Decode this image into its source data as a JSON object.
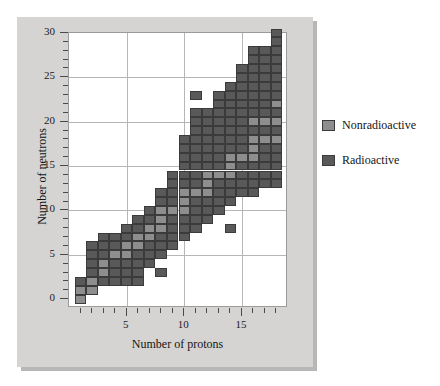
{
  "chart_data": {
    "type": "heatmap",
    "title": "",
    "xlabel": "Number of protons",
    "ylabel": "Number of neutrons",
    "xlim": [
      0,
      19
    ],
    "ylim": [
      -1,
      30
    ],
    "grid": true,
    "legend_position": "right",
    "x_major_ticks": [
      5,
      10,
      15
    ],
    "x_major_tick_labels": [
      "5",
      "10",
      "15"
    ],
    "x_minor_ticks": [
      1,
      2,
      3,
      4,
      6,
      7,
      8,
      9,
      11,
      12,
      13,
      14,
      16,
      17,
      18
    ],
    "y_major_ticks": [
      0,
      5,
      10,
      15,
      20,
      25,
      30
    ],
    "y_major_tick_labels": [
      "0",
      "5",
      "10",
      "15",
      "20",
      "25",
      "30"
    ],
    "y_minor_ticks": [
      1,
      2,
      3,
      4,
      6,
      7,
      8,
      9,
      11,
      12,
      13,
      14,
      16,
      17,
      18,
      19,
      21,
      22,
      23,
      24,
      26,
      27,
      28,
      29
    ],
    "categories_x": [
      1,
      2,
      3,
      4,
      5,
      6,
      7,
      8,
      9,
      10,
      11,
      12,
      13,
      14,
      15,
      16,
      17,
      18
    ],
    "legend": [
      {
        "label": "Nonradioactive",
        "color": "#8e8e8e"
      },
      {
        "label": "Radioactive",
        "color": "#595959"
      }
    ],
    "colors": {
      "nonradioactive": "#8e8e8e",
      "radioactive": "#595959",
      "cell_border": "#3b3b3b",
      "panel_background": "#d6d4d2",
      "plot_background": "#ffffff",
      "gridline": "#b6b6b6",
      "axis": "#9a9a9a",
      "text": "#141414"
    },
    "cells": [
      {
        "p": 1,
        "n": 0,
        "s": "nonradioactive"
      },
      {
        "p": 1,
        "n": 1,
        "s": "nonradioactive"
      },
      {
        "p": 1,
        "n": 2,
        "s": "radioactive"
      },
      {
        "p": 2,
        "n": 1,
        "s": "nonradioactive"
      },
      {
        "p": 2,
        "n": 2,
        "s": "nonradioactive"
      },
      {
        "p": 2,
        "n": 3,
        "s": "radioactive"
      },
      {
        "p": 2,
        "n": 4,
        "s": "radioactive"
      },
      {
        "p": 2,
        "n": 5,
        "s": "radioactive"
      },
      {
        "p": 2,
        "n": 6,
        "s": "radioactive"
      },
      {
        "p": 3,
        "n": 2,
        "s": "radioactive"
      },
      {
        "p": 3,
        "n": 3,
        "s": "nonradioactive"
      },
      {
        "p": 3,
        "n": 4,
        "s": "nonradioactive"
      },
      {
        "p": 3,
        "n": 5,
        "s": "radioactive"
      },
      {
        "p": 3,
        "n": 6,
        "s": "radioactive"
      },
      {
        "p": 3,
        "n": 7,
        "s": "radioactive"
      },
      {
        "p": 4,
        "n": 2,
        "s": "radioactive"
      },
      {
        "p": 4,
        "n": 3,
        "s": "radioactive"
      },
      {
        "p": 4,
        "n": 4,
        "s": "radioactive"
      },
      {
        "p": 4,
        "n": 5,
        "s": "nonradioactive"
      },
      {
        "p": 4,
        "n": 6,
        "s": "radioactive"
      },
      {
        "p": 4,
        "n": 7,
        "s": "radioactive"
      },
      {
        "p": 5,
        "n": 2,
        "s": "radioactive"
      },
      {
        "p": 5,
        "n": 3,
        "s": "radioactive"
      },
      {
        "p": 5,
        "n": 4,
        "s": "radioactive"
      },
      {
        "p": 5,
        "n": 5,
        "s": "nonradioactive"
      },
      {
        "p": 5,
        "n": 6,
        "s": "nonradioactive"
      },
      {
        "p": 5,
        "n": 7,
        "s": "radioactive"
      },
      {
        "p": 5,
        "n": 8,
        "s": "radioactive"
      },
      {
        "p": 6,
        "n": 2,
        "s": "radioactive"
      },
      {
        "p": 6,
        "n": 3,
        "s": "radioactive"
      },
      {
        "p": 6,
        "n": 4,
        "s": "radioactive"
      },
      {
        "p": 6,
        "n": 5,
        "s": "radioactive"
      },
      {
        "p": 6,
        "n": 6,
        "s": "nonradioactive"
      },
      {
        "p": 6,
        "n": 7,
        "s": "nonradioactive"
      },
      {
        "p": 6,
        "n": 8,
        "s": "radioactive"
      },
      {
        "p": 6,
        "n": 9,
        "s": "radioactive"
      },
      {
        "p": 7,
        "n": 4,
        "s": "radioactive"
      },
      {
        "p": 7,
        "n": 5,
        "s": "radioactive"
      },
      {
        "p": 7,
        "n": 6,
        "s": "radioactive"
      },
      {
        "p": 7,
        "n": 7,
        "s": "nonradioactive"
      },
      {
        "p": 7,
        "n": 8,
        "s": "nonradioactive"
      },
      {
        "p": 7,
        "n": 9,
        "s": "radioactive"
      },
      {
        "p": 7,
        "n": 10,
        "s": "radioactive"
      },
      {
        "p": 8,
        "n": 3,
        "s": "radioactive"
      },
      {
        "p": 8,
        "n": 5,
        "s": "radioactive"
      },
      {
        "p": 8,
        "n": 6,
        "s": "radioactive"
      },
      {
        "p": 8,
        "n": 7,
        "s": "radioactive"
      },
      {
        "p": 8,
        "n": 8,
        "s": "nonradioactive"
      },
      {
        "p": 8,
        "n": 9,
        "s": "nonradioactive"
      },
      {
        "p": 8,
        "n": 10,
        "s": "nonradioactive"
      },
      {
        "p": 8,
        "n": 11,
        "s": "radioactive"
      },
      {
        "p": 8,
        "n": 12,
        "s": "radioactive"
      },
      {
        "p": 9,
        "n": 6,
        "s": "radioactive"
      },
      {
        "p": 9,
        "n": 7,
        "s": "radioactive"
      },
      {
        "p": 9,
        "n": 8,
        "s": "radioactive"
      },
      {
        "p": 9,
        "n": 9,
        "s": "radioactive"
      },
      {
        "p": 9,
        "n": 10,
        "s": "nonradioactive"
      },
      {
        "p": 9,
        "n": 11,
        "s": "radioactive"
      },
      {
        "p": 9,
        "n": 12,
        "s": "radioactive"
      },
      {
        "p": 9,
        "n": 13,
        "s": "radioactive"
      },
      {
        "p": 9,
        "n": 14,
        "s": "radioactive"
      },
      {
        "p": 10,
        "n": 7,
        "s": "radioactive"
      },
      {
        "p": 10,
        "n": 8,
        "s": "radioactive"
      },
      {
        "p": 10,
        "n": 9,
        "s": "radioactive"
      },
      {
        "p": 10,
        "n": 10,
        "s": "nonradioactive"
      },
      {
        "p": 10,
        "n": 11,
        "s": "nonradioactive"
      },
      {
        "p": 10,
        "n": 12,
        "s": "nonradioactive"
      },
      {
        "p": 10,
        "n": 13,
        "s": "radioactive"
      },
      {
        "p": 10,
        "n": 14,
        "s": "radioactive"
      },
      {
        "p": 10,
        "n": 15,
        "s": "radioactive"
      },
      {
        "p": 10,
        "n": 16,
        "s": "radioactive"
      },
      {
        "p": 10,
        "n": 17,
        "s": "radioactive"
      },
      {
        "p": 10,
        "n": 18,
        "s": "radioactive"
      },
      {
        "p": 11,
        "n": 8,
        "s": "radioactive"
      },
      {
        "p": 11,
        "n": 9,
        "s": "radioactive"
      },
      {
        "p": 11,
        "n": 10,
        "s": "radioactive"
      },
      {
        "p": 11,
        "n": 11,
        "s": "radioactive"
      },
      {
        "p": 11,
        "n": 12,
        "s": "nonradioactive"
      },
      {
        "p": 11,
        "n": 13,
        "s": "radioactive"
      },
      {
        "p": 11,
        "n": 14,
        "s": "radioactive"
      },
      {
        "p": 11,
        "n": 15,
        "s": "radioactive"
      },
      {
        "p": 11,
        "n": 16,
        "s": "radioactive"
      },
      {
        "p": 11,
        "n": 17,
        "s": "radioactive"
      },
      {
        "p": 11,
        "n": 18,
        "s": "radioactive"
      },
      {
        "p": 11,
        "n": 19,
        "s": "radioactive"
      },
      {
        "p": 11,
        "n": 20,
        "s": "radioactive"
      },
      {
        "p": 11,
        "n": 21,
        "s": "radioactive"
      },
      {
        "p": 11,
        "n": 23,
        "s": "radioactive"
      },
      {
        "p": 12,
        "n": 9,
        "s": "radioactive"
      },
      {
        "p": 12,
        "n": 10,
        "s": "radioactive"
      },
      {
        "p": 12,
        "n": 11,
        "s": "radioactive"
      },
      {
        "p": 12,
        "n": 12,
        "s": "nonradioactive"
      },
      {
        "p": 12,
        "n": 13,
        "s": "nonradioactive"
      },
      {
        "p": 12,
        "n": 14,
        "s": "nonradioactive"
      },
      {
        "p": 12,
        "n": 15,
        "s": "radioactive"
      },
      {
        "p": 12,
        "n": 16,
        "s": "radioactive"
      },
      {
        "p": 12,
        "n": 17,
        "s": "radioactive"
      },
      {
        "p": 12,
        "n": 18,
        "s": "radioactive"
      },
      {
        "p": 12,
        "n": 19,
        "s": "radioactive"
      },
      {
        "p": 12,
        "n": 20,
        "s": "radioactive"
      },
      {
        "p": 12,
        "n": 21,
        "s": "radioactive"
      },
      {
        "p": 13,
        "n": 10,
        "s": "radioactive"
      },
      {
        "p": 13,
        "n": 11,
        "s": "radioactive"
      },
      {
        "p": 13,
        "n": 12,
        "s": "radioactive"
      },
      {
        "p": 13,
        "n": 13,
        "s": "radioactive"
      },
      {
        "p": 13,
        "n": 14,
        "s": "nonradioactive"
      },
      {
        "p": 13,
        "n": 15,
        "s": "radioactive"
      },
      {
        "p": 13,
        "n": 16,
        "s": "radioactive"
      },
      {
        "p": 13,
        "n": 17,
        "s": "radioactive"
      },
      {
        "p": 13,
        "n": 18,
        "s": "radioactive"
      },
      {
        "p": 13,
        "n": 19,
        "s": "radioactive"
      },
      {
        "p": 13,
        "n": 20,
        "s": "radioactive"
      },
      {
        "p": 13,
        "n": 21,
        "s": "radioactive"
      },
      {
        "p": 13,
        "n": 22,
        "s": "radioactive"
      },
      {
        "p": 13,
        "n": 23,
        "s": "radioactive"
      },
      {
        "p": 14,
        "n": 8,
        "s": "radioactive"
      },
      {
        "p": 14,
        "n": 11,
        "s": "radioactive"
      },
      {
        "p": 14,
        "n": 12,
        "s": "radioactive"
      },
      {
        "p": 14,
        "n": 13,
        "s": "radioactive"
      },
      {
        "p": 14,
        "n": 14,
        "s": "nonradioactive"
      },
      {
        "p": 14,
        "n": 15,
        "s": "nonradioactive"
      },
      {
        "p": 14,
        "n": 16,
        "s": "nonradioactive"
      },
      {
        "p": 14,
        "n": 17,
        "s": "radioactive"
      },
      {
        "p": 14,
        "n": 18,
        "s": "radioactive"
      },
      {
        "p": 14,
        "n": 19,
        "s": "radioactive"
      },
      {
        "p": 14,
        "n": 20,
        "s": "radioactive"
      },
      {
        "p": 14,
        "n": 21,
        "s": "radioactive"
      },
      {
        "p": 14,
        "n": 22,
        "s": "radioactive"
      },
      {
        "p": 14,
        "n": 23,
        "s": "radioactive"
      },
      {
        "p": 14,
        "n": 24,
        "s": "radioactive"
      },
      {
        "p": 15,
        "n": 12,
        "s": "radioactive"
      },
      {
        "p": 15,
        "n": 13,
        "s": "radioactive"
      },
      {
        "p": 15,
        "n": 14,
        "s": "radioactive"
      },
      {
        "p": 15,
        "n": 15,
        "s": "radioactive"
      },
      {
        "p": 15,
        "n": 16,
        "s": "nonradioactive"
      },
      {
        "p": 15,
        "n": 17,
        "s": "radioactive"
      },
      {
        "p": 15,
        "n": 18,
        "s": "radioactive"
      },
      {
        "p": 15,
        "n": 19,
        "s": "radioactive"
      },
      {
        "p": 15,
        "n": 20,
        "s": "radioactive"
      },
      {
        "p": 15,
        "n": 21,
        "s": "radioactive"
      },
      {
        "p": 15,
        "n": 22,
        "s": "radioactive"
      },
      {
        "p": 15,
        "n": 23,
        "s": "radioactive"
      },
      {
        "p": 15,
        "n": 24,
        "s": "radioactive"
      },
      {
        "p": 15,
        "n": 25,
        "s": "radioactive"
      },
      {
        "p": 15,
        "n": 26,
        "s": "radioactive"
      },
      {
        "p": 16,
        "n": 12,
        "s": "radioactive"
      },
      {
        "p": 16,
        "n": 13,
        "s": "radioactive"
      },
      {
        "p": 16,
        "n": 14,
        "s": "radioactive"
      },
      {
        "p": 16,
        "n": 15,
        "s": "radioactive"
      },
      {
        "p": 16,
        "n": 16,
        "s": "nonradioactive"
      },
      {
        "p": 16,
        "n": 17,
        "s": "nonradioactive"
      },
      {
        "p": 16,
        "n": 18,
        "s": "nonradioactive"
      },
      {
        "p": 16,
        "n": 19,
        "s": "radioactive"
      },
      {
        "p": 16,
        "n": 20,
        "s": "nonradioactive"
      },
      {
        "p": 16,
        "n": 21,
        "s": "radioactive"
      },
      {
        "p": 16,
        "n": 22,
        "s": "radioactive"
      },
      {
        "p": 16,
        "n": 23,
        "s": "radioactive"
      },
      {
        "p": 16,
        "n": 24,
        "s": "radioactive"
      },
      {
        "p": 16,
        "n": 25,
        "s": "radioactive"
      },
      {
        "p": 16,
        "n": 26,
        "s": "radioactive"
      },
      {
        "p": 16,
        "n": 27,
        "s": "radioactive"
      },
      {
        "p": 16,
        "n": 28,
        "s": "radioactive"
      },
      {
        "p": 17,
        "n": 13,
        "s": "radioactive"
      },
      {
        "p": 17,
        "n": 14,
        "s": "radioactive"
      },
      {
        "p": 17,
        "n": 15,
        "s": "radioactive"
      },
      {
        "p": 17,
        "n": 16,
        "s": "radioactive"
      },
      {
        "p": 17,
        "n": 17,
        "s": "radioactive"
      },
      {
        "p": 17,
        "n": 18,
        "s": "nonradioactive"
      },
      {
        "p": 17,
        "n": 19,
        "s": "radioactive"
      },
      {
        "p": 17,
        "n": 20,
        "s": "nonradioactive"
      },
      {
        "p": 17,
        "n": 21,
        "s": "radioactive"
      },
      {
        "p": 17,
        "n": 22,
        "s": "radioactive"
      },
      {
        "p": 17,
        "n": 23,
        "s": "radioactive"
      },
      {
        "p": 17,
        "n": 24,
        "s": "radioactive"
      },
      {
        "p": 17,
        "n": 25,
        "s": "radioactive"
      },
      {
        "p": 17,
        "n": 26,
        "s": "radioactive"
      },
      {
        "p": 17,
        "n": 27,
        "s": "radioactive"
      },
      {
        "p": 17,
        "n": 28,
        "s": "radioactive"
      },
      {
        "p": 18,
        "n": 13,
        "s": "radioactive"
      },
      {
        "p": 18,
        "n": 14,
        "s": "radioactive"
      },
      {
        "p": 18,
        "n": 15,
        "s": "radioactive"
      },
      {
        "p": 18,
        "n": 16,
        "s": "radioactive"
      },
      {
        "p": 18,
        "n": 17,
        "s": "radioactive"
      },
      {
        "p": 18,
        "n": 18,
        "s": "nonradioactive"
      },
      {
        "p": 18,
        "n": 19,
        "s": "radioactive"
      },
      {
        "p": 18,
        "n": 20,
        "s": "nonradioactive"
      },
      {
        "p": 18,
        "n": 21,
        "s": "radioactive"
      },
      {
        "p": 18,
        "n": 22,
        "s": "nonradioactive"
      },
      {
        "p": 18,
        "n": 23,
        "s": "radioactive"
      },
      {
        "p": 18,
        "n": 24,
        "s": "radioactive"
      },
      {
        "p": 18,
        "n": 25,
        "s": "radioactive"
      },
      {
        "p": 18,
        "n": 26,
        "s": "radioactive"
      },
      {
        "p": 18,
        "n": 27,
        "s": "radioactive"
      },
      {
        "p": 18,
        "n": 28,
        "s": "radioactive"
      },
      {
        "p": 18,
        "n": 29,
        "s": "radioactive"
      },
      {
        "p": 18,
        "n": 30,
        "s": "radioactive"
      }
    ]
  }
}
